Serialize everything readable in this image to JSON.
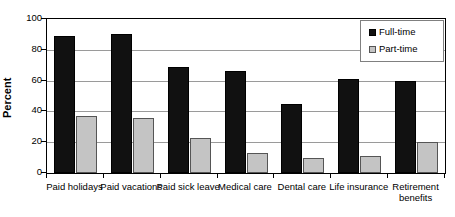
{
  "chart_data": {
    "type": "bar",
    "title": "",
    "xlabel": "",
    "ylabel": "Percent",
    "ylim": [
      0,
      100
    ],
    "yticks": [
      0,
      20,
      40,
      60,
      80,
      100
    ],
    "grid": true,
    "legend_position": "top-right",
    "categories": [
      "Paid holidays",
      "Paid vacations",
      "Paid sick leave",
      "Medical care",
      "Dental care",
      "Life insurance",
      "Retirement benefits"
    ],
    "series": [
      {
        "name": "Full-time",
        "color": "#111111",
        "values": [
          89,
          90,
          69,
          66,
          45,
          61,
          60
        ]
      },
      {
        "name": "Part-time",
        "color": "#c4c4c4",
        "values": [
          37,
          36,
          23,
          13,
          10,
          11,
          20
        ]
      }
    ]
  },
  "axis": {
    "y_title": "Percent",
    "y_tick_labels": [
      "100",
      "80",
      "60",
      "40",
      "20",
      "0"
    ]
  },
  "legend": {
    "items": [
      {
        "label": "Full-time",
        "swatch": "black-square-swatch"
      },
      {
        "label": "Part-time",
        "swatch": "gray-square-swatch"
      }
    ]
  }
}
